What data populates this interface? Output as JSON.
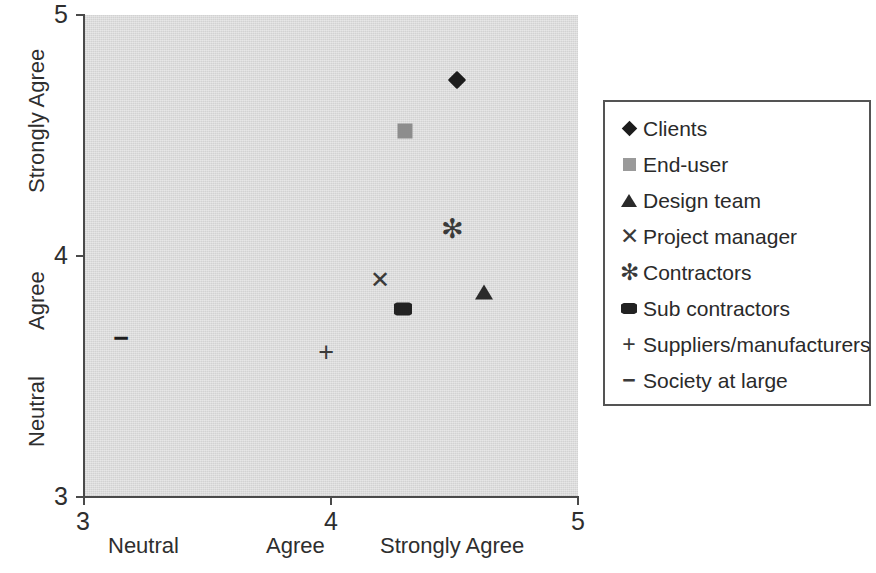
{
  "chart_data": {
    "type": "scatter",
    "title": "",
    "xlabel": "",
    "ylabel": "",
    "xlim": [
      3,
      5
    ],
    "ylim": [
      3,
      5
    ],
    "grid": false,
    "legend_position": "right",
    "x_ticks": [
      "3",
      "4",
      "5"
    ],
    "x_tick_values": [
      3,
      4,
      5
    ],
    "y_ticks": [
      "5",
      "4",
      "3"
    ],
    "y_tick_values": [
      5,
      4,
      3
    ],
    "x_category_labels": [
      "Neutral",
      "Agree",
      "Strongly Agree"
    ],
    "y_category_labels": [
      "Strongly Agree",
      "Agree",
      "Neutral"
    ],
    "series": [
      {
        "name": "Clients",
        "marker": "diamond",
        "color": "#1c1c1c",
        "x": 4.51,
        "y": 4.73
      },
      {
        "name": "End-user",
        "marker": "square",
        "color": "#8d8d8d",
        "x": 4.3,
        "y": 4.52
      },
      {
        "name": "Design team",
        "marker": "triangle",
        "color": "#2a2a2a",
        "x": 4.62,
        "y": 3.85
      },
      {
        "name": "Project manager",
        "marker": "x",
        "color": "#3a3a3a",
        "x": 4.2,
        "y": 3.9
      },
      {
        "name": "Contractors",
        "marker": "asterisk",
        "color": "#3a3a3a",
        "x": 4.49,
        "y": 4.11
      },
      {
        "name": "Sub contractors",
        "marker": "hexagon",
        "color": "#222222",
        "x": 4.29,
        "y": 3.78
      },
      {
        "name": "Suppliers/manufacturers",
        "marker": "plus",
        "color": "#3a3a3a",
        "x": 3.98,
        "y": 3.6
      },
      {
        "name": "Society at large",
        "marker": "dash",
        "color": "#1c1c1c",
        "x": 3.15,
        "y": 3.66
      }
    ]
  },
  "axes": {
    "y_tick_5": "5",
    "y_tick_4": "4",
    "y_tick_3": "3",
    "x_tick_3": "3",
    "x_tick_4": "4",
    "x_tick_5": "5",
    "y_cat_strongly_agree": "Strongly Agree",
    "y_cat_agree": "Agree",
    "y_cat_neutral": "Neutral",
    "x_cat_neutral": "Neutral",
    "x_cat_agree": "Agree",
    "x_cat_strongly_agree": "Strongly Agree"
  },
  "legend": {
    "items": [
      {
        "label": "Clients",
        "glyph": "",
        "key_type": "diamond"
      },
      {
        "label": "End-user",
        "glyph": "",
        "key_type": "square-gray"
      },
      {
        "label": "Design team",
        "glyph": "",
        "key_type": "triangle"
      },
      {
        "label": "Project manager",
        "glyph": "✕",
        "key_type": "glyph"
      },
      {
        "label": "Contractors",
        "glyph": "✻",
        "key_type": "glyph"
      },
      {
        "label": "Sub contractors",
        "glyph": "",
        "key_type": "hexagon"
      },
      {
        "label": "Suppliers/manufacturers",
        "glyph": "+",
        "key_type": "glyph"
      },
      {
        "label": "Society at large",
        "glyph": "−",
        "key_type": "glyph"
      }
    ]
  },
  "markers": {
    "project_manager_glyph": "✕",
    "contractors_glyph": "✻",
    "suppliers_glyph": "+",
    "society_glyph": "−"
  },
  "colors": {
    "plot_background": "#d2d2d2",
    "axis": "#4a4a4a",
    "text": "#2a2a2a",
    "marker_dark": "#1c1c1c",
    "marker_gray": "#8d8d8d",
    "legend_border": "#545454"
  }
}
